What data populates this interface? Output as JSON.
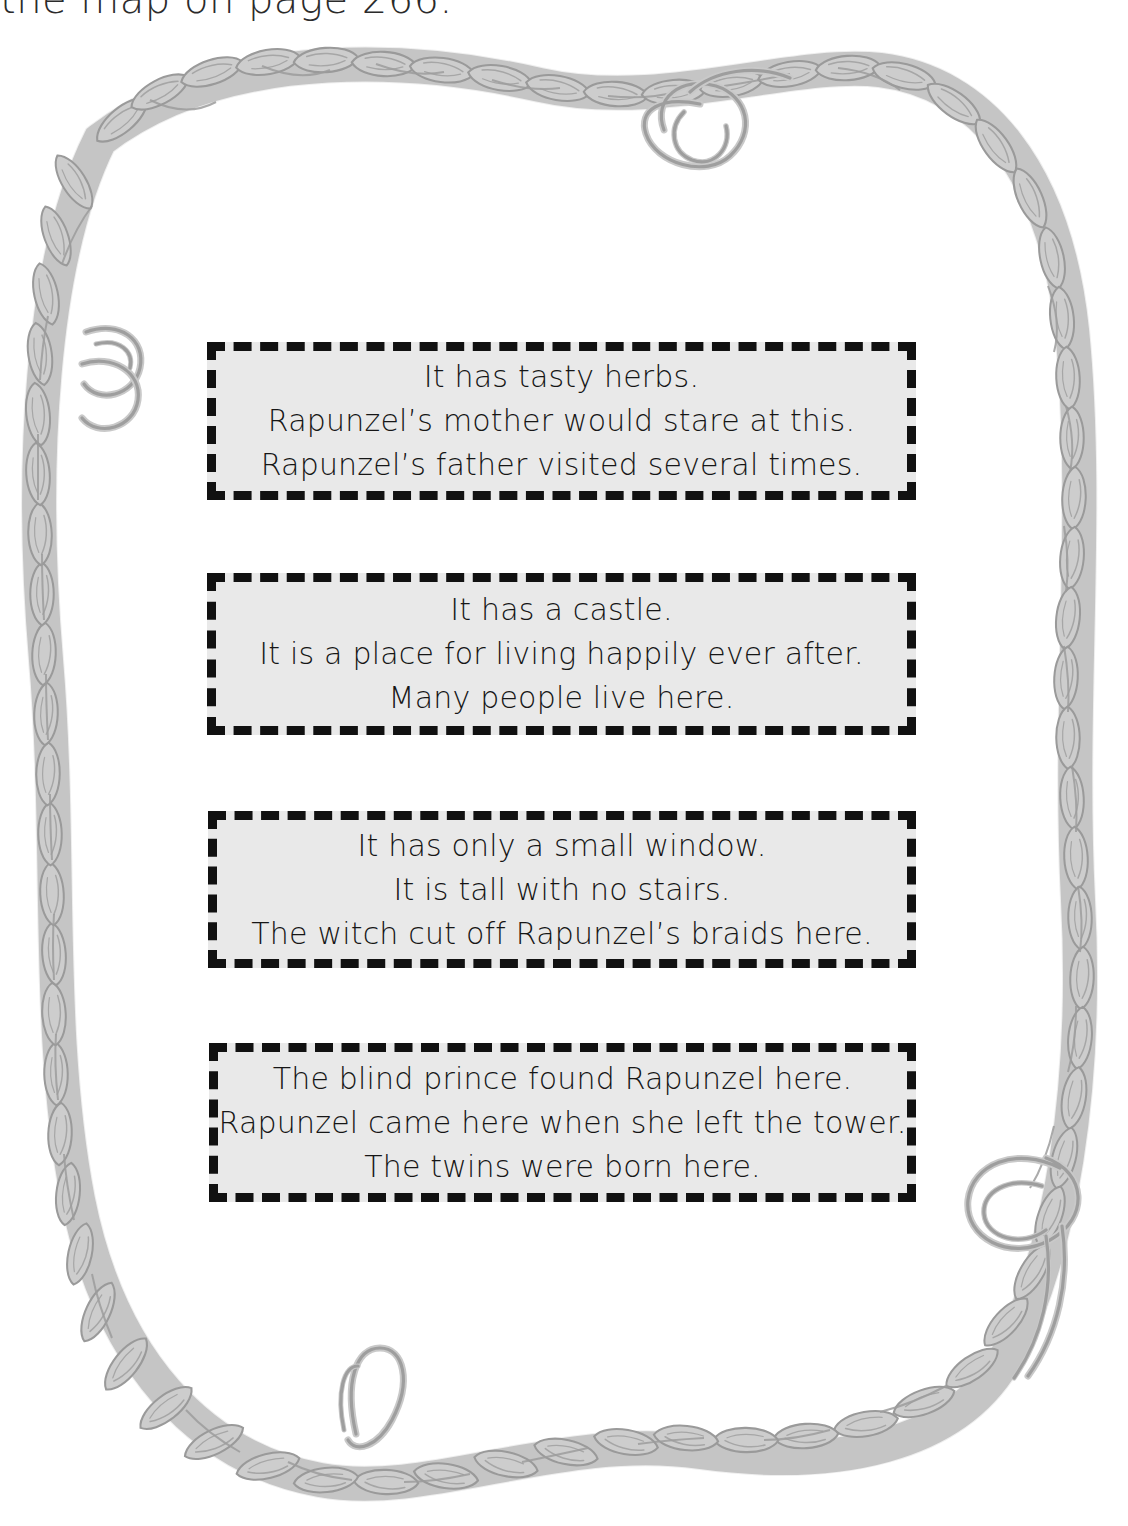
{
  "page": {
    "width": 1128,
    "height": 1526,
    "background_color": "#ffffff",
    "top_heading_partial": "the map on page 266.",
    "theme": "rapunzel-setting-clue-cards"
  },
  "frame": {
    "name": "braided-hair-border",
    "description": "Gray braided rope / plait of hair forming an irregular rounded frame around the page with loose curled tendrils",
    "fill_color": "#cacaca",
    "stroke_color": "#9a9a9a",
    "curls": [
      {
        "name": "top-center-curl"
      },
      {
        "name": "left-upper-curl"
      },
      {
        "name": "bottom-left-loop"
      },
      {
        "name": "bottom-right-curl"
      }
    ]
  },
  "cards": {
    "style": {
      "fill_color": "#e9e9e9",
      "border_color": "#111111",
      "border_style": "dashed",
      "text_color": "#161616"
    },
    "items": [
      {
        "id": "card-1",
        "name": "clue-card-garden",
        "lines": [
          "It has tasty herbs.",
          "Rapunzel’s mother would stare at this.",
          "Rapunzel’s father visited several times."
        ]
      },
      {
        "id": "card-2",
        "name": "clue-card-kingdom",
        "lines": [
          "It has a castle.",
          "It is a place for living happily ever after.",
          "Many people live here."
        ]
      },
      {
        "id": "card-3",
        "name": "clue-card-tower",
        "lines": [
          "It has only a small window.",
          "It is tall with no stairs.",
          "The witch cut off Rapunzel’s braids here."
        ]
      },
      {
        "id": "card-4",
        "name": "clue-card-wilderness",
        "lines": [
          "The blind prince found Rapunzel here.",
          "Rapunzel came here when she left the tower.",
          "The twins were born here."
        ]
      }
    ]
  }
}
